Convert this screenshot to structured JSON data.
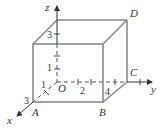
{
  "diagram": {
    "type": "3d-coordinate-box",
    "colors": {
      "edge": "#808080",
      "axis": "#333333",
      "text": "#333333"
    },
    "axes": {
      "x_label": "x",
      "y_label": "y",
      "z_label": "z",
      "origin_label": "O"
    },
    "vertices": {
      "A": "A",
      "B": "B",
      "C": "C",
      "D": "D"
    },
    "tick_labels": {
      "x_1": "1",
      "x_3": "3",
      "y_2": "2",
      "y_4": "4",
      "z_1": "1",
      "z_3": "3"
    }
  }
}
